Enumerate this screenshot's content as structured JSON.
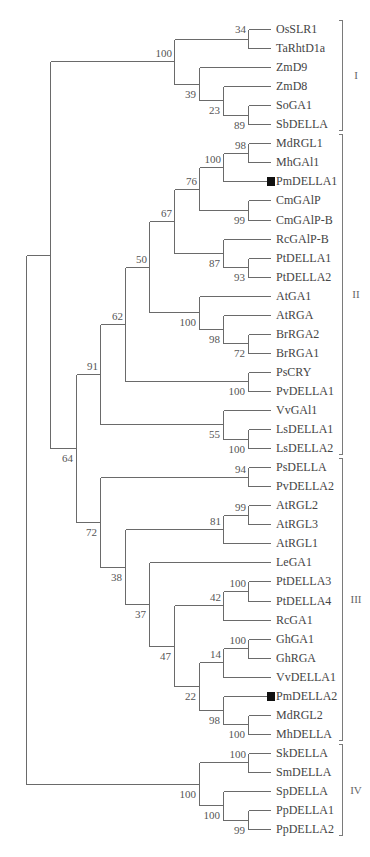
{
  "figure": {
    "type": "phylogenetic-tree",
    "layout": {
      "tip_y0": 29,
      "tip_dy": 19.05,
      "tip_x": 270,
      "label_x": 276,
      "columns": [
        26,
        50,
        76,
        100,
        125,
        149,
        174,
        199,
        223,
        248
      ]
    },
    "tips": [
      {
        "label": "OsSLR1"
      },
      {
        "label": "TaRhtD1a"
      },
      {
        "label": "ZmD9"
      },
      {
        "label": "ZmD8"
      },
      {
        "label": "SoGA1"
      },
      {
        "label": "SbDELLA"
      },
      {
        "label": "MdRGL1"
      },
      {
        "label": "MhGAl1"
      },
      {
        "label": "PmDELLA1",
        "marker": true
      },
      {
        "label": "CmGAlP"
      },
      {
        "label": "CmGAlP-B"
      },
      {
        "label": "RcGAlP-B"
      },
      {
        "label": "PtDELLA1"
      },
      {
        "label": "PtDELLA2"
      },
      {
        "label": "AtGA1"
      },
      {
        "label": "AtRGA"
      },
      {
        "label": "BrRGA2"
      },
      {
        "label": "BrRGA1"
      },
      {
        "label": "PsCRY"
      },
      {
        "label": "PvDELLA1"
      },
      {
        "label": "VvGAl1"
      },
      {
        "label": "LsDELLA1"
      },
      {
        "label": "LsDELLA2"
      },
      {
        "label": "PsDELLA"
      },
      {
        "label": "PvDELLA2"
      },
      {
        "label": "AtRGL2"
      },
      {
        "label": "AtRGL3"
      },
      {
        "label": "AtRGL1"
      },
      {
        "label": "LeGA1"
      },
      {
        "label": "PtDELLA3"
      },
      {
        "label": "PtDELLA4"
      },
      {
        "label": "RcGA1"
      },
      {
        "label": "GhGA1"
      },
      {
        "label": "GhRGA"
      },
      {
        "label": "VvDELLA1"
      },
      {
        "label": "PmDELLA2",
        "marker": true
      },
      {
        "label": "MdRGL2"
      },
      {
        "label": "MhDELLA"
      },
      {
        "label": "SkDELLA"
      },
      {
        "label": "SmDELLA"
      },
      {
        "label": "SpDELLA"
      },
      {
        "label": "PpDELLA1"
      },
      {
        "label": "PpDELLA2"
      }
    ],
    "nodes": {
      "n34": {
        "col": 9,
        "children": [
          "t0",
          "t1"
        ],
        "support": "34",
        "pos": "above-left"
      },
      "n89": {
        "col": 9,
        "children": [
          "t4",
          "t5"
        ],
        "support": "89",
        "pos": "below"
      },
      "n23": {
        "col": 8,
        "children": [
          "t3",
          "n89"
        ],
        "support": "23",
        "pos": "below"
      },
      "n39": {
        "col": 7,
        "children": [
          "t2",
          "n23"
        ],
        "support": "39",
        "pos": "below"
      },
      "n100a": {
        "col": 6,
        "children": [
          "n34",
          "n39"
        ],
        "support": "100",
        "pos": "above"
      },
      "n98a": {
        "col": 9,
        "children": [
          "t6",
          "t7"
        ],
        "support": "98",
        "pos": "above"
      },
      "n100b": {
        "col": 8,
        "children": [
          "n98a",
          "t8"
        ],
        "support": "100",
        "pos": "above"
      },
      "n99a": {
        "col": 9,
        "children": [
          "t9",
          "t10"
        ],
        "support": "99",
        "pos": "below"
      },
      "n76": {
        "col": 7,
        "children": [
          "n100b",
          "n99a"
        ],
        "support": "76",
        "pos": "above"
      },
      "n93": {
        "col": 9,
        "children": [
          "t12",
          "t13"
        ],
        "support": "93",
        "pos": "below"
      },
      "n87": {
        "col": 8,
        "children": [
          "t11",
          "n93"
        ],
        "support": "87",
        "pos": "below"
      },
      "n67": {
        "col": 6,
        "children": [
          "n76",
          "n87"
        ],
        "support": "67",
        "pos": "above"
      },
      "n72a": {
        "col": 9,
        "children": [
          "t16",
          "t17"
        ],
        "support": "72",
        "pos": "below"
      },
      "n98b": {
        "col": 8,
        "children": [
          "t15",
          "n72a"
        ],
        "support": "98",
        "pos": "below"
      },
      "n100c": {
        "col": 7,
        "children": [
          "t14",
          "n98b"
        ],
        "support": "100",
        "pos": "below"
      },
      "n50": {
        "col": 5,
        "children": [
          "n67",
          "n100c"
        ],
        "support": "50",
        "pos": "above"
      },
      "n100d": {
        "col": 9,
        "children": [
          "t18",
          "t19"
        ],
        "support": "100",
        "pos": "below"
      },
      "n62": {
        "col": 4,
        "children": [
          "n50",
          "n100d"
        ],
        "support": "62",
        "pos": "above"
      },
      "n100e": {
        "col": 9,
        "children": [
          "t21",
          "t22"
        ],
        "support": "100",
        "pos": "below"
      },
      "n55": {
        "col": 8,
        "children": [
          "t20",
          "n100e"
        ],
        "support": "55",
        "pos": "below"
      },
      "n91": {
        "col": 3,
        "children": [
          "n62",
          "n55"
        ],
        "support": "91",
        "pos": "above"
      },
      "n94": {
        "col": 9,
        "children": [
          "t23",
          "t24"
        ],
        "support": "94",
        "pos": "above"
      },
      "n99b": {
        "col": 9,
        "children": [
          "t25",
          "t26"
        ],
        "support": "99",
        "pos": "above"
      },
      "n81": {
        "col": 8,
        "children": [
          "n99b",
          "t27"
        ],
        "support": "81",
        "pos": "above"
      },
      "n100f": {
        "col": 9,
        "children": [
          "t29",
          "t30"
        ],
        "support": "100",
        "pos": "above"
      },
      "n42": {
        "col": 8,
        "children": [
          "n100f",
          "t31"
        ],
        "support": "42",
        "pos": "above"
      },
      "n100g": {
        "col": 9,
        "children": [
          "t32",
          "t33"
        ],
        "support": "100",
        "pos": "above"
      },
      "n14": {
        "col": 8,
        "children": [
          "n100g",
          "t34"
        ],
        "support": "14",
        "pos": "above"
      },
      "n100h": {
        "col": 9,
        "children": [
          "t36",
          "t37"
        ],
        "support": "100",
        "pos": "below"
      },
      "n98c": {
        "col": 8,
        "children": [
          "t35",
          "n100h"
        ],
        "support": "98",
        "pos": "below"
      },
      "n22": {
        "col": 7,
        "children": [
          "n14",
          "n98c"
        ],
        "support": "22",
        "pos": "below"
      },
      "n47": {
        "col": 6,
        "children": [
          "n42",
          "n22"
        ],
        "support": "47",
        "pos": "below"
      },
      "n37": {
        "col": 5,
        "children": [
          "t28",
          "n47"
        ],
        "support": "37",
        "pos": "below"
      },
      "n38": {
        "col": 4,
        "children": [
          "n81",
          "n37"
        ],
        "support": "38",
        "pos": "below"
      },
      "n72b": {
        "col": 3,
        "children": [
          "n94",
          "n38"
        ],
        "support": "72",
        "pos": "below"
      },
      "n64": {
        "col": 2,
        "children": [
          "n91",
          "n72b"
        ],
        "support": "64",
        "pos": "below"
      },
      "ntop": {
        "col": 1,
        "children": [
          "n100a",
          "n64"
        ],
        "support": "",
        "pos": "none"
      },
      "n100i": {
        "col": 9,
        "children": [
          "t38",
          "t39"
        ],
        "support": "100",
        "pos": "above"
      },
      "n99c": {
        "col": 9,
        "children": [
          "t41",
          "t42"
        ],
        "support": "99",
        "pos": "below"
      },
      "n100j": {
        "col": 8,
        "children": [
          "t40",
          "n99c"
        ],
        "support": "100",
        "pos": "below"
      },
      "n100k": {
        "col": 7,
        "children": [
          "n100i",
          "n100j"
        ],
        "support": "100",
        "pos": "below"
      },
      "root": {
        "col": 0,
        "children": [
          "ntop",
          "n100k"
        ],
        "support": "",
        "pos": "none"
      }
    },
    "root": "root",
    "clades": [
      {
        "label": "I",
        "from": 0,
        "to": 5
      },
      {
        "label": "II",
        "from": 6,
        "to": 22
      },
      {
        "label": "III",
        "from": 23,
        "to": 37
      },
      {
        "label": "IV",
        "from": 38,
        "to": 42
      }
    ],
    "colors": {
      "branch": "#6a6a6a",
      "text": "#444444",
      "marker": "#111111"
    }
  }
}
